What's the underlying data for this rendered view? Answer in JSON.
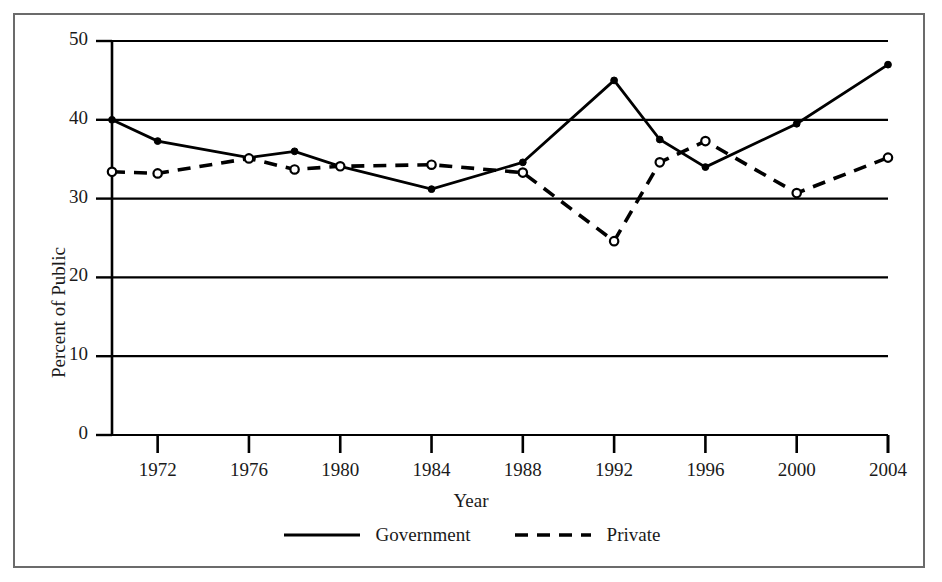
{
  "chart_data": {
    "type": "line",
    "title": "",
    "xlabel": "Year",
    "ylabel": "Percent of Public",
    "xlim": [
      1970,
      2004
    ],
    "ylim": [
      0,
      50
    ],
    "grid": true,
    "gridlines_y": [
      0,
      10,
      20,
      30,
      40,
      50
    ],
    "legend_position": "bottom",
    "ytick_labels": [
      "0",
      "10",
      "20",
      "30",
      "40",
      "50"
    ],
    "ytick_values": [
      0,
      10,
      20,
      30,
      40,
      50
    ],
    "xtick_labels": [
      "1972",
      "1976",
      "1980",
      "1984",
      "1988",
      "1992",
      "1996",
      "2000",
      "2004"
    ],
    "xtick_values": [
      1972,
      1976,
      1980,
      1984,
      1988,
      1992,
      1996,
      2000,
      2004
    ],
    "series": [
      {
        "name": "Government",
        "style": "solid",
        "marker": "filled-circle",
        "color": "#000000",
        "x": [
          1970,
          1972,
          1976,
          1978,
          1980,
          1984,
          1988,
          1992,
          1994,
          1996,
          2000,
          2004
        ],
        "values": [
          40.0,
          37.3,
          35.2,
          36.0,
          34.1,
          31.2,
          34.6,
          45.0,
          37.5,
          34.0,
          39.5,
          47.0
        ]
      },
      {
        "name": "Private",
        "style": "dashed",
        "marker": "open-circle",
        "color": "#000000",
        "x": [
          1970,
          1972,
          1976,
          1978,
          1980,
          1984,
          1988,
          1992,
          1994,
          1996,
          2000,
          2004
        ],
        "values": [
          33.4,
          33.2,
          35.1,
          33.7,
          34.1,
          34.3,
          33.3,
          24.6,
          34.6,
          37.3,
          30.7,
          35.2
        ]
      }
    ]
  },
  "legend": {
    "items": [
      {
        "label": "Government",
        "style": "solid"
      },
      {
        "label": "Private",
        "style": "dashed"
      }
    ]
  },
  "axes": {
    "x_title": "Year",
    "y_title": "Percent of Public"
  }
}
